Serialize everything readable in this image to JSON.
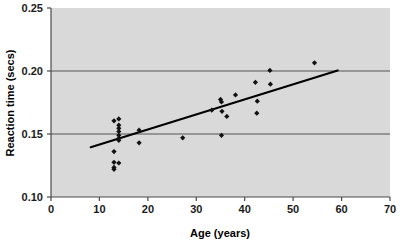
{
  "chart_data": {
    "type": "scatter",
    "title": "",
    "xlabel": "Age (years)",
    "ylabel": "Reaction time (secs)",
    "xlim": [
      0,
      70
    ],
    "ylim": [
      0.1,
      0.25
    ],
    "xticks": [
      "0",
      "10",
      "20",
      "30",
      "40",
      "50",
      "60",
      "70"
    ],
    "xtick_values": [
      0,
      10,
      20,
      30,
      40,
      50,
      60,
      70
    ],
    "yticks": [
      "0.10",
      "0.15",
      "0.20",
      "0.25"
    ],
    "ytick_values": [
      0.1,
      0.15,
      0.2,
      0.25
    ],
    "grid": true,
    "grid_axis": "y",
    "legend": "none",
    "plot_background": "#d9d9d9",
    "marker_color": "#111111",
    "marker_shape": "diamond",
    "trendline_color": "#000000",
    "points": [
      {
        "x": 13.0,
        "y": 0.1605
      },
      {
        "x": 14.0,
        "y": 0.162
      },
      {
        "x": 14.0,
        "y": 0.157
      },
      {
        "x": 14.0,
        "y": 0.1545
      },
      {
        "x": 14.0,
        "y": 0.152
      },
      {
        "x": 14.0,
        "y": 0.149
      },
      {
        "x": 14.0,
        "y": 0.1465
      },
      {
        "x": 14.0,
        "y": 0.145
      },
      {
        "x": 13.0,
        "y": 0.136
      },
      {
        "x": 13.0,
        "y": 0.1275
      },
      {
        "x": 14.0,
        "y": 0.127
      },
      {
        "x": 13.0,
        "y": 0.1235
      },
      {
        "x": 13.0,
        "y": 0.122
      },
      {
        "x": 18.2,
        "y": 0.153
      },
      {
        "x": 18.2,
        "y": 0.143
      },
      {
        "x": 27.2,
        "y": 0.147
      },
      {
        "x": 33.2,
        "y": 0.169
      },
      {
        "x": 35.0,
        "y": 0.1775
      },
      {
        "x": 35.2,
        "y": 0.1755
      },
      {
        "x": 35.3,
        "y": 0.168
      },
      {
        "x": 35.2,
        "y": 0.149
      },
      {
        "x": 36.3,
        "y": 0.164
      },
      {
        "x": 38.1,
        "y": 0.181
      },
      {
        "x": 42.2,
        "y": 0.191
      },
      {
        "x": 42.6,
        "y": 0.176
      },
      {
        "x": 42.5,
        "y": 0.1665
      },
      {
        "x": 45.2,
        "y": 0.2005
      },
      {
        "x": 45.3,
        "y": 0.1895
      },
      {
        "x": 54.4,
        "y": 0.2065
      }
    ],
    "trendline": {
      "x_start": 8.2,
      "y_start": 0.1395,
      "x_end": 59.2,
      "y_end": 0.2005
    }
  }
}
